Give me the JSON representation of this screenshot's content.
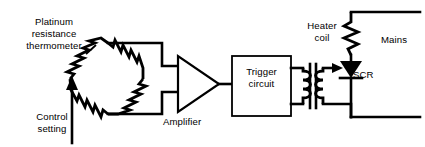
{
  "diagram": {
    "type": "schematic",
    "background_color": "#ffffff",
    "line_color": "#000000",
    "labels": {
      "platinum_line1": "Platinum",
      "platinum_line2": "resistance",
      "platinum_line3": "thermometer",
      "control_line1": "Control",
      "control_line2": "setting",
      "amplifier": "Amplifier",
      "trigger_line1": "Trigger",
      "trigger_line2": "circuit",
      "heater_line1": "Heater",
      "heater_line2": "coil",
      "scr": "SCR",
      "mains": "Mains"
    },
    "components": [
      {
        "name": "wheatstone-bridge",
        "label": "Platinum resistance thermometer bridge",
        "resistor_count": 4,
        "shape": "diamond"
      },
      {
        "name": "control-setting-arrow",
        "label": "Control setting",
        "type": "adjustable-resistor-arrow"
      },
      {
        "name": "amplifier",
        "label": "Amplifier",
        "type": "triangle"
      },
      {
        "name": "trigger-circuit",
        "label": "Trigger circuit",
        "type": "box"
      },
      {
        "name": "pulse-transformer",
        "label": "",
        "type": "transformer"
      },
      {
        "name": "scr",
        "label": "SCR",
        "type": "thyristor"
      },
      {
        "name": "heater-coil",
        "label": "Heater coil",
        "type": "resistor"
      },
      {
        "name": "mains",
        "label": "Mains",
        "type": "supply-terminals"
      }
    ],
    "signal_flow": [
      "wheatstone-bridge",
      "amplifier",
      "trigger-circuit",
      "pulse-transformer",
      "scr",
      "heater-coil",
      "mains"
    ]
  }
}
